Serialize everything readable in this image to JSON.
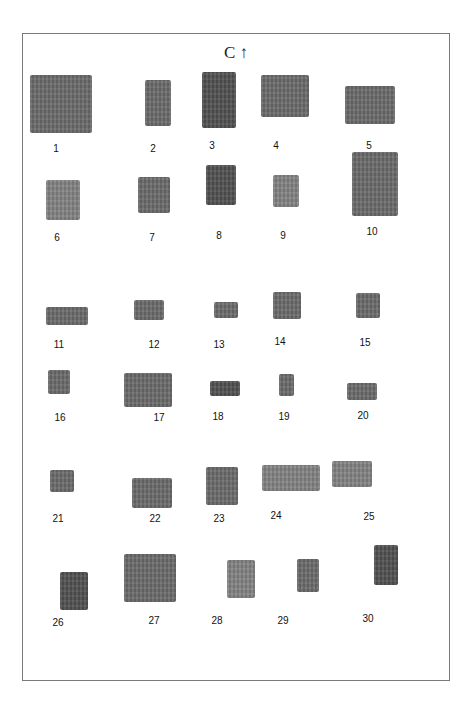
{
  "plate": {
    "title": "C ↑",
    "running_head": "· · · · · · · ·"
  },
  "fragments": [
    {
      "number": "1",
      "x": 30,
      "y": 75,
      "w": 62,
      "h": 58,
      "label_x": 50,
      "label_y": 143
    },
    {
      "number": "2",
      "x": 145,
      "y": 80,
      "w": 26,
      "h": 46,
      "label_x": 147,
      "label_y": 143
    },
    {
      "number": "3",
      "x": 202,
      "y": 72,
      "w": 34,
      "h": 56,
      "label_x": 206,
      "label_y": 140
    },
    {
      "number": "4",
      "x": 261,
      "y": 75,
      "w": 48,
      "h": 42,
      "label_x": 270,
      "label_y": 140
    },
    {
      "number": "5",
      "x": 345,
      "y": 86,
      "w": 50,
      "h": 38,
      "label_x": 363,
      "label_y": 140
    },
    {
      "number": "6",
      "x": 46,
      "y": 180,
      "w": 34,
      "h": 40,
      "label_x": 51,
      "label_y": 232
    },
    {
      "number": "7",
      "x": 138,
      "y": 177,
      "w": 32,
      "h": 36,
      "label_x": 146,
      "label_y": 232
    },
    {
      "number": "8",
      "x": 206,
      "y": 165,
      "w": 30,
      "h": 40,
      "label_x": 213,
      "label_y": 230
    },
    {
      "number": "9",
      "x": 273,
      "y": 175,
      "w": 26,
      "h": 32,
      "label_x": 277,
      "label_y": 230
    },
    {
      "number": "10",
      "x": 352,
      "y": 152,
      "w": 46,
      "h": 64,
      "label_x": 366,
      "label_y": 226
    },
    {
      "number": "11",
      "x": 46,
      "y": 307,
      "w": 42,
      "h": 18,
      "label_x": 53,
      "label_y": 339
    },
    {
      "number": "12",
      "x": 134,
      "y": 300,
      "w": 30,
      "h": 20,
      "label_x": 148,
      "label_y": 339
    },
    {
      "number": "13",
      "x": 214,
      "y": 302,
      "w": 24,
      "h": 16,
      "label_x": 213,
      "label_y": 339
    },
    {
      "number": "14",
      "x": 273,
      "y": 292,
      "w": 28,
      "h": 27,
      "label_x": 274,
      "label_y": 336
    },
    {
      "number": "15",
      "x": 356,
      "y": 293,
      "w": 24,
      "h": 25,
      "label_x": 359,
      "label_y": 337
    },
    {
      "number": "16",
      "x": 48,
      "y": 370,
      "w": 22,
      "h": 24,
      "label_x": 54,
      "label_y": 412
    },
    {
      "number": "17",
      "x": 124,
      "y": 373,
      "w": 48,
      "h": 34,
      "label_x": 153,
      "label_y": 412
    },
    {
      "number": "18",
      "x": 210,
      "y": 381,
      "w": 30,
      "h": 15,
      "label_x": 212,
      "label_y": 411
    },
    {
      "number": "19",
      "x": 279,
      "y": 374,
      "w": 15,
      "h": 22,
      "label_x": 278,
      "label_y": 411
    },
    {
      "number": "20",
      "x": 347,
      "y": 383,
      "w": 30,
      "h": 17,
      "label_x": 357,
      "label_y": 410
    },
    {
      "number": "21",
      "x": 50,
      "y": 470,
      "w": 24,
      "h": 22,
      "label_x": 52,
      "label_y": 513
    },
    {
      "number": "22",
      "x": 132,
      "y": 478,
      "w": 40,
      "h": 30,
      "label_x": 149,
      "label_y": 513
    },
    {
      "number": "23",
      "x": 206,
      "y": 467,
      "w": 32,
      "h": 38,
      "label_x": 213,
      "label_y": 513
    },
    {
      "number": "24",
      "x": 262,
      "y": 465,
      "w": 58,
      "h": 26,
      "label_x": 270,
      "label_y": 510
    },
    {
      "number": "25",
      "x": 332,
      "y": 461,
      "w": 40,
      "h": 26,
      "label_x": 363,
      "label_y": 511
    },
    {
      "number": "26",
      "x": 60,
      "y": 572,
      "w": 28,
      "h": 38,
      "label_x": 52,
      "label_y": 617
    },
    {
      "number": "27",
      "x": 124,
      "y": 554,
      "w": 52,
      "h": 48,
      "label_x": 148,
      "label_y": 615
    },
    {
      "number": "28",
      "x": 227,
      "y": 560,
      "w": 28,
      "h": 38,
      "label_x": 211,
      "label_y": 615
    },
    {
      "number": "29",
      "x": 297,
      "y": 559,
      "w": 22,
      "h": 33,
      "label_x": 277,
      "label_y": 615
    },
    {
      "number": "30",
      "x": 374,
      "y": 545,
      "w": 24,
      "h": 40,
      "label_x": 362,
      "label_y": 613
    }
  ],
  "tones": {
    "frame_border": "#7a7a7a",
    "fragment_fill": "#6e6e6e",
    "label_text": "#111111"
  }
}
